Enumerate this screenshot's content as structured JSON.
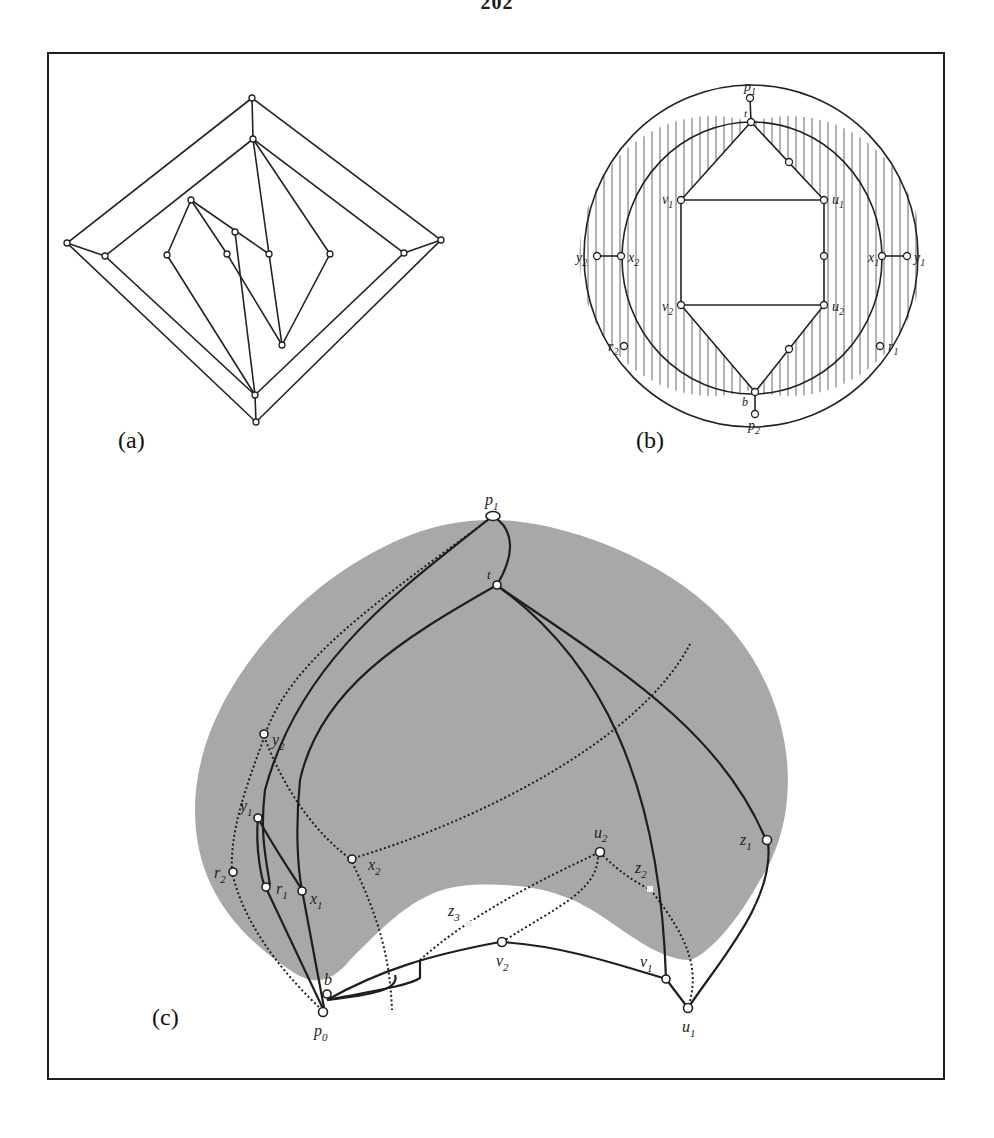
{
  "page": {
    "number": "202"
  },
  "figure": {
    "panels": [
      {
        "id": "a",
        "caption": "(a)"
      },
      {
        "id": "b",
        "caption": "(b)"
      },
      {
        "id": "c",
        "caption": "(c)"
      }
    ],
    "panel_b_labels": {
      "p1": "p",
      "p1_sub": "1",
      "t": "t",
      "v1": "v",
      "v1_sub": "1",
      "u1": "u",
      "u1_sub": "1",
      "y2": "y",
      "y2_sub": "2",
      "x2": "x",
      "x2_sub": "2",
      "x1": "x",
      "x1_sub": "1",
      "y1": "y",
      "y1_sub": "1",
      "v2": "v",
      "v2_sub": "2",
      "u2": "u",
      "u2_sub": "2",
      "r2": "r",
      "r2_sub": "2",
      "r1": "r",
      "r1_sub": "1",
      "b": "b",
      "p2": "p",
      "p2_sub": "2"
    },
    "panel_c_labels": {
      "p1": "p",
      "p1_sub": "1",
      "t": "t",
      "y2": "y",
      "y2_sub": "2",
      "y1": "y",
      "y1_sub": "1",
      "x2": "x",
      "x2_sub": "2",
      "r2": "r",
      "r2_sub": "2",
      "r1": "r",
      "r1_sub": "1",
      "x1": "x",
      "x1_sub": "1",
      "z3": "z",
      "z3_sub": "3",
      "v2": "v",
      "v2_sub": "2",
      "u2": "u",
      "u2_sub": "2",
      "z2": "z",
      "z2_sub": "2",
      "z1": "z",
      "z1_sub": "1",
      "v1": "v",
      "v1_sub": "1",
      "u1": "u",
      "u1_sub": "1",
      "b": "b",
      "p0": "p",
      "p0_sub": "0"
    },
    "colors": {
      "stroke": "#222222",
      "region_fill": "#a6a6a6",
      "hatch": "#555555",
      "background": "#ffffff"
    }
  }
}
